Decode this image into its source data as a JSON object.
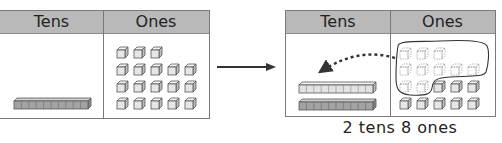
{
  "before": {
    "headers": {
      "tens": "Tens",
      "ones": "Ones"
    },
    "tens_rods": 1,
    "ones_rows": [
      3,
      5,
      5,
      5
    ],
    "ones_total": 18
  },
  "transition_arrow": "right-arrow",
  "after": {
    "headers": {
      "tens": "Tens",
      "ones": "Ones"
    },
    "tens_rods": 2,
    "regrouped_ones": {
      "count": 10,
      "rows": [
        3,
        5,
        2
      ],
      "style": "dashed-faded",
      "circled": true
    },
    "remaining_ones": {
      "count": 8,
      "rows": [
        3,
        5
      ]
    },
    "regroup_arrow": "dotted-curved-arrow-to-tens",
    "caption": "2 tens 8 ones"
  },
  "colors": {
    "header_bg": "#b9b9b9",
    "border": "#7a7a7a",
    "rod_fill_light": "#e2e2e2",
    "rod_fill_dark": "#9e9e9e",
    "cube_face": "#e6e6e6",
    "text": "#222222"
  }
}
